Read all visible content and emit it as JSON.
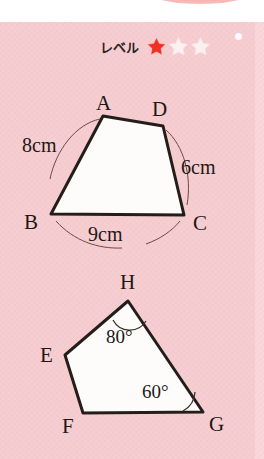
{
  "worksheet": {
    "background_color": "#f6ccd0",
    "level": {
      "label": "レベル",
      "stars_total": 3,
      "stars_filled": 1,
      "filled_color": "#ee3124",
      "empty_color": "#fdf0f0"
    }
  },
  "figure1": {
    "name": "quadrilateral-abcd",
    "fill_color": "#fdfcfa",
    "stroke_color": "#241d1a",
    "vertices": [
      {
        "id": "A",
        "label": "A",
        "x": 103,
        "y": 116,
        "label_x": 96,
        "label_y": 93
      },
      {
        "id": "D",
        "label": "D",
        "x": 163,
        "y": 126,
        "label_x": 152,
        "label_y": 99
      },
      {
        "id": "C",
        "label": "C",
        "x": 184,
        "y": 215,
        "label_x": 193,
        "label_y": 213
      },
      {
        "id": "B",
        "label": "B",
        "x": 51,
        "y": 214,
        "label_x": 24,
        "label_y": 212
      }
    ],
    "measurements": [
      {
        "id": "ab",
        "text": "8cm",
        "x": 22,
        "y": 135,
        "side": "A-B"
      },
      {
        "id": "dc",
        "text": "6cm",
        "x": 181,
        "y": 157,
        "side": "D-C"
      },
      {
        "id": "bc",
        "text": "9cm",
        "x": 88,
        "y": 224,
        "side": "B-C"
      }
    ],
    "arcs": [
      {
        "id": "arc-ab",
        "d": "M 100 119 C 76 124 56 150 50 179"
      },
      {
        "id": "arc-dc",
        "d": "M 166 130 C 184 146 192 176 187 205"
      },
      {
        "id": "arc-bc",
        "d": "M 56 221 C 74 241 98 249 122 248"
      },
      {
        "id": "arc-bc2",
        "d": "M 146 244 C 160 239 172 231 180 221"
      }
    ]
  },
  "figure2": {
    "name": "quadrilateral-efgh",
    "fill_color": "#fdfcfa",
    "stroke_color": "#241d1a",
    "vertices": [
      {
        "id": "H",
        "label": "H",
        "x": 128,
        "y": 301,
        "label_x": 120,
        "label_y": 272
      },
      {
        "id": "G",
        "label": "G",
        "x": 203,
        "y": 412,
        "label_x": 209,
        "label_y": 414
      },
      {
        "id": "F",
        "label": "F",
        "x": 83,
        "y": 413,
        "label_x": 62,
        "label_y": 416
      },
      {
        "id": "E",
        "label": "E",
        "x": 65,
        "y": 355,
        "label_x": 40,
        "label_y": 345
      }
    ],
    "angles": [
      {
        "id": "angle-h",
        "text": "80°",
        "x": 106,
        "y": 327,
        "vertex": "H",
        "value": 80
      },
      {
        "id": "angle-g",
        "text": "60°",
        "x": 142,
        "y": 382,
        "vertex": "G",
        "value": 60
      }
    ],
    "angle_arcs": [
      {
        "id": "arc-angle-h",
        "d": "M 113 320 A 19 19 0 0 0 146 321"
      },
      {
        "id": "arc-angle-g",
        "d": "M 183 411 A 23 23 0 0 0 195 392"
      }
    ]
  }
}
